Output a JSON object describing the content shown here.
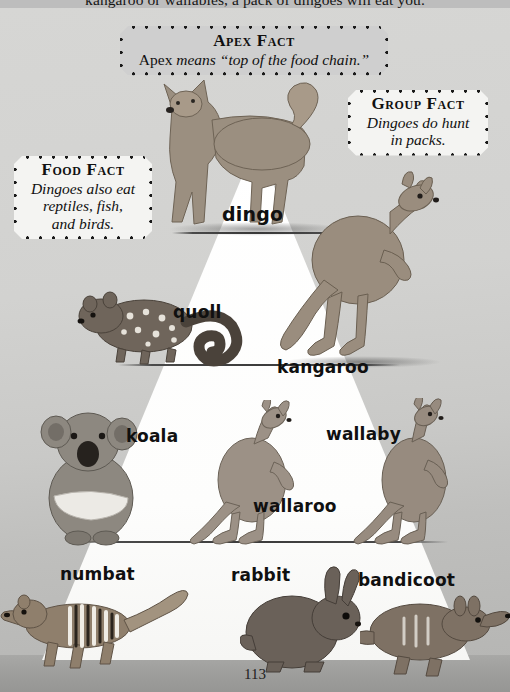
{
  "page": {
    "number": "113",
    "body_text": "kangaroo or wallabies, a pack of dingoes will eat you.",
    "background_color": "#c9c9c7",
    "pyramid_color": "#ffffff",
    "floor_color": "#9d9d9b"
  },
  "fact_boxes": [
    {
      "id": "apex-fact",
      "title": "Apex Fact",
      "title_initial": "A",
      "title_rest": "pex ",
      "body_lead": "Apex ",
      "body_italic": "means “top of the food chain.”",
      "lines": [
        "Apex means “top of the food chain.”"
      ],
      "fill": "#cfcfcf"
    },
    {
      "id": "group-fact",
      "title": "Group Fact",
      "lines": [
        "Dingoes do hunt",
        "in packs."
      ],
      "fill": "#f4f4f2"
    },
    {
      "id": "food-fact",
      "title": "Food Fact",
      "lines": [
        "Dingoes also eat",
        "reptiles, fish,",
        "and birds."
      ],
      "fill": "#f4f4f2"
    }
  ],
  "pyramid": {
    "levels": [
      {
        "tier": 1,
        "labels": [
          "dingo"
        ]
      },
      {
        "tier": 2,
        "labels": [
          "quoll",
          "kangaroo"
        ]
      },
      {
        "tier": 3,
        "labels": [
          "koala",
          "wallaroo",
          "wallaby"
        ]
      },
      {
        "tier": 4,
        "labels": [
          "numbat",
          "rabbit",
          "bandicoot"
        ]
      }
    ]
  },
  "animal_labels": {
    "dingo": "dingo",
    "quoll": "quoll",
    "kangaroo": "kangaroo",
    "koala": "koala",
    "wallaroo": "wallaroo",
    "wallaby": "wallaby",
    "numbat": "numbat",
    "rabbit": "rabbit",
    "bandicoot": "bandicoot"
  }
}
